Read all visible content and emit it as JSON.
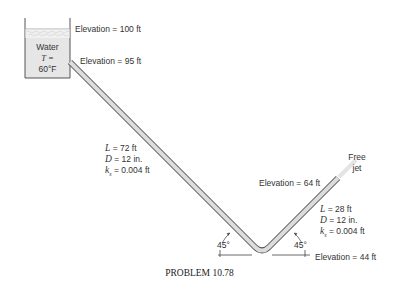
{
  "tank": {
    "fluid": "Water",
    "temp_label": "T =",
    "temp_value": "60°F"
  },
  "elevations": {
    "water_surface": "Elevation = 100 ft",
    "pipe_entrance": "Elevation = 95 ft",
    "pipe_exit": "Elevation = 64 ft",
    "pipe_bottom": "Elevation = 44 ft"
  },
  "pipe1": {
    "length": "L = 72 ft",
    "diameter": "D = 12 in.",
    "roughness": "ks = 0.004 ft",
    "roughness_symbol": "k",
    "roughness_sub": "s",
    "roughness_value": " = 0.004 ft",
    "length_symbol": "L",
    "length_value": " = 72 ft",
    "diameter_symbol": "D",
    "diameter_value": " = 12 in."
  },
  "pipe2": {
    "length_symbol": "L",
    "length_value": " = 28 ft",
    "diameter_symbol": "D",
    "diameter_value": " = 12 in.",
    "roughness_symbol": "k",
    "roughness_sub": "s",
    "roughness_value": " = 0.004 ft"
  },
  "angles": {
    "left": "45°",
    "right": "45°"
  },
  "outlet": {
    "line1": "Free",
    "line2": "jet"
  },
  "caption": "PROBLEM 10.78"
}
